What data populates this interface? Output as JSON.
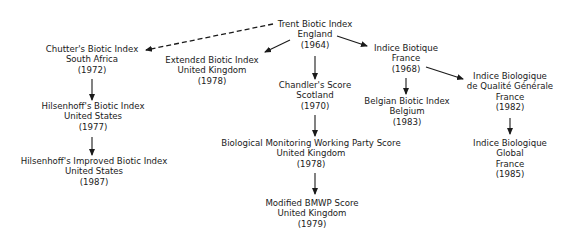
{
  "diagram": {
    "nodes": [
      {
        "id": "trent",
        "name": "Trent Biotic Index",
        "country": "England",
        "year": "(1964)"
      },
      {
        "id": "chutter",
        "name": "Chutter's Biotic Index",
        "country": "South Africa",
        "year": "(1972)"
      },
      {
        "id": "extended",
        "name": "Extendɛd Biotic Index",
        "country": "United Kingdom",
        "year": "(1978)"
      },
      {
        "id": "indice_biotique",
        "name": "Indice Biotique",
        "country": "France",
        "year": "(1968)"
      },
      {
        "id": "hilsenhoff",
        "name": "Hilsenhoff's Biotic Index",
        "country": "United States",
        "year": "(1977)"
      },
      {
        "id": "chandler",
        "name": "Chandler's Score",
        "country": "Scotland",
        "year": "(1970)"
      },
      {
        "id": "ibqg",
        "name": "Indice Biologique",
        "name2": "de Qualité Générale",
        "country": "France",
        "year": "(1982)"
      },
      {
        "id": "belgian",
        "name": "Belgian Biotic Index",
        "country": "Belgium",
        "year": "(1983)"
      },
      {
        "id": "hilsenhoff_improved",
        "name": "Hilsenhoff's Improved Biotic Index",
        "country": "United States",
        "year": "(1987)"
      },
      {
        "id": "bmwp",
        "name": "Biological Monitoring Working Party Score",
        "country": "United Kingdom",
        "year": "(1978)"
      },
      {
        "id": "ibg",
        "name": "Indice Biologique",
        "name2": "Global",
        "country": "France",
        "year": "(1985)"
      },
      {
        "id": "mbmwp",
        "name": "Modified BMWP Score",
        "country": "United Kingdom",
        "year": "(1979)"
      }
    ],
    "edges": [
      {
        "from": "trent",
        "to": "chutter",
        "style": "dashed"
      },
      {
        "from": "trent",
        "to": "extended",
        "style": "solid"
      },
      {
        "from": "trent",
        "to": "indice_biotique",
        "style": "solid"
      },
      {
        "from": "trent",
        "to": "chandler",
        "style": "solid"
      },
      {
        "from": "chutter",
        "to": "hilsenhoff",
        "style": "solid"
      },
      {
        "from": "hilsenhoff",
        "to": "hilsenhoff_improved",
        "style": "solid"
      },
      {
        "from": "indice_biotique",
        "to": "belgian",
        "style": "solid"
      },
      {
        "from": "indice_biotique",
        "to": "ibqg",
        "style": "solid"
      },
      {
        "from": "ibqg",
        "to": "ibg",
        "style": "solid"
      },
      {
        "from": "chandler",
        "to": "bmwp",
        "style": "solid"
      },
      {
        "from": "bmwp",
        "to": "mbmwp",
        "style": "solid"
      }
    ]
  }
}
